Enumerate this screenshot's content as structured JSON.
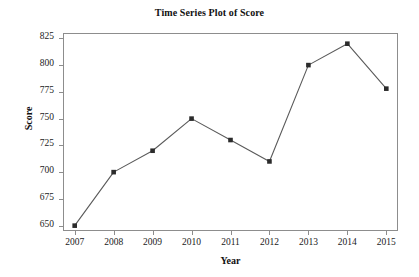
{
  "chart_data": {
    "type": "line",
    "title": "Time Series Plot of Score",
    "xlabel": "Year",
    "ylabel": "Score",
    "categories": [
      "2007",
      "2008",
      "2009",
      "2010",
      "2011",
      "2012",
      "2013",
      "2014",
      "2015"
    ],
    "x": [
      2007,
      2008,
      2009,
      2010,
      2011,
      2012,
      2013,
      2014,
      2015
    ],
    "values": [
      650,
      700,
      720,
      750,
      730,
      710,
      800,
      820,
      778
    ],
    "series": [
      {
        "name": "Score",
        "values": [
          650,
          700,
          720,
          750,
          730,
          710,
          800,
          820,
          778
        ]
      }
    ],
    "ylim": [
      645,
      830
    ],
    "xlim": [
      2006.7,
      2015.3
    ],
    "yticks": [
      650,
      675,
      700,
      725,
      750,
      775,
      800,
      825
    ],
    "ytick_labels": [
      "650",
      "675",
      "700",
      "725",
      "750",
      "775",
      "800",
      "825"
    ],
    "xticks": [
      2007,
      2008,
      2009,
      2010,
      2011,
      2012,
      2013,
      2014,
      2015
    ],
    "xtick_labels": [
      "2007",
      "2008",
      "2009",
      "2010",
      "2011",
      "2012",
      "2013",
      "2014",
      "2015"
    ],
    "grid": false,
    "legend": false,
    "legend_position": "none",
    "marker": "square",
    "line_color": "#5a5a5a",
    "marker_color": "#2b2b2b",
    "frame_color": "#8d8d8d",
    "background_color": "#ffffff"
  }
}
